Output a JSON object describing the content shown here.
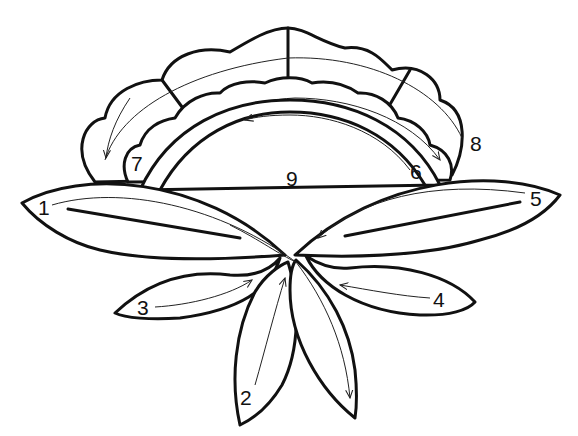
{
  "diagram": {
    "labels": [
      {
        "id": "1",
        "text": "1",
        "part": "left large leaf"
      },
      {
        "id": "2",
        "text": "2",
        "part": "lower center-left petal"
      },
      {
        "id": "3",
        "text": "3",
        "part": "small left leaf"
      },
      {
        "id": "4",
        "text": "4",
        "part": "small right leaf"
      },
      {
        "id": "5",
        "text": "5",
        "part": "right large leaf"
      },
      {
        "id": "6",
        "text": "6",
        "part": "inner arc band"
      },
      {
        "id": "7",
        "text": "7",
        "part": "inner scalloped petals"
      },
      {
        "id": "8",
        "text": "8",
        "part": "outer scalloped petals"
      },
      {
        "id": "9",
        "text": "9",
        "part": "flower center"
      }
    ],
    "colors": {
      "line": "#111111",
      "background": "#ffffff"
    }
  }
}
